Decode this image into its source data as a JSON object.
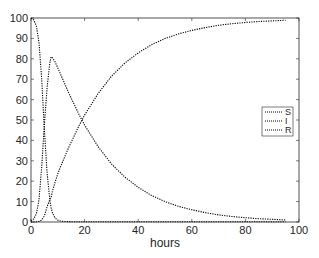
{
  "chart_data": {
    "type": "line",
    "title": "",
    "xlabel": "hours",
    "ylabel": "",
    "xlim": [
      0,
      100
    ],
    "ylim": [
      0,
      100
    ],
    "xticks": [
      "0",
      "20",
      "40",
      "60",
      "80",
      "100"
    ],
    "yticks": [
      "0",
      "10",
      "20",
      "30",
      "40",
      "50",
      "60",
      "70",
      "80",
      "90",
      "100"
    ],
    "grid": false,
    "legend_position": "east",
    "line_style": "dotted",
    "line_color": "#000000",
    "x": [
      0,
      1,
      2,
      3,
      4,
      5,
      6,
      7,
      7.5,
      8,
      9,
      10,
      11,
      12,
      14,
      16,
      18,
      20,
      25,
      30,
      35,
      40,
      45,
      50,
      55,
      60,
      65,
      70,
      75,
      80,
      85,
      90,
      95
    ],
    "series": [
      {
        "name": "S",
        "values": [
          100,
          99,
          96,
          88,
          70,
          45,
          24,
          11,
          7,
          4.5,
          2,
          0.9,
          0.5,
          0.3,
          0.2,
          0.1,
          0.1,
          0.1,
          0.1,
          0.1,
          0.1,
          0.1,
          0.1,
          0.1,
          0.1,
          0.1,
          0.1,
          0.1,
          0.1,
          0.1,
          0.1,
          0.1,
          0.1
        ]
      },
      {
        "name": "I",
        "values": [
          0.5,
          1.5,
          4,
          11,
          27,
          48,
          66,
          78,
          81,
          80.5,
          78.5,
          75.5,
          72.5,
          69.5,
          63.5,
          58,
          52.5,
          47.5,
          37,
          28.5,
          22,
          17,
          13,
          10,
          7.7,
          6,
          4.6,
          3.5,
          2.7,
          2.1,
          1.6,
          1.3,
          1
        ]
      },
      {
        "name": "R",
        "values": [
          0,
          0,
          0.1,
          0.3,
          1,
          3,
          7.5,
          11,
          12,
          15,
          19.5,
          23.6,
          27,
          30.2,
          36.3,
          41.9,
          47.4,
          52.4,
          62.9,
          71.4,
          77.9,
          82.9,
          86.9,
          89.9,
          92.2,
          93.9,
          95.3,
          96.4,
          97.2,
          97.8,
          98.3,
          98.6,
          98.9
        ]
      }
    ]
  }
}
